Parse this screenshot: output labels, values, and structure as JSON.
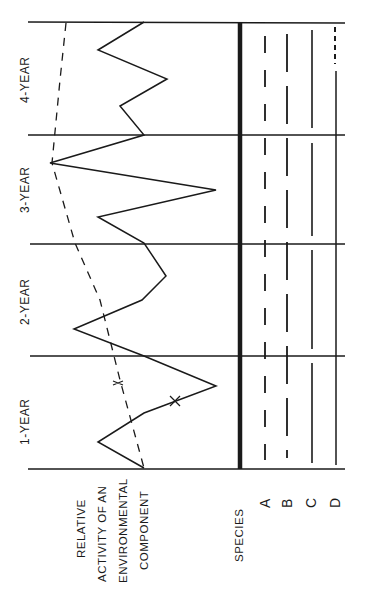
{
  "colors": {
    "ink": "#1a1a1a",
    "background": "#ffffff"
  },
  "periods": [
    {
      "label": "1-YEAR"
    },
    {
      "label": "2-YEAR"
    },
    {
      "label": "3-YEAR"
    },
    {
      "label": "4-YEAR"
    }
  ],
  "axis": {
    "line1": "RELATIVE",
    "line2": "ACTIVITY OF AN",
    "line3": "ENVIRONMENTAL",
    "line4": "COMPONENT"
  },
  "species": {
    "title": "SPECIES",
    "items": [
      {
        "letter": "A",
        "pattern": "short-dash"
      },
      {
        "letter": "B",
        "pattern": "long-dash"
      },
      {
        "letter": "C",
        "pattern": "solid-with-breaks"
      },
      {
        "letter": "D",
        "pattern": "solid, dotted at end of 4-year"
      }
    ]
  },
  "curves": {
    "x": {
      "label": "X",
      "style": "solid"
    },
    "y": {
      "label": "Y",
      "style": "dashed"
    }
  }
}
